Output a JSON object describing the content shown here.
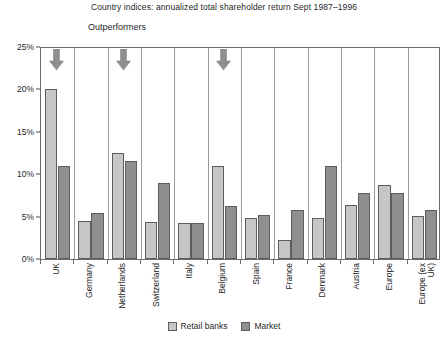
{
  "chart_data": {
    "type": "bar",
    "title": "Country indices: annualized total shareholder return Sept 1987–1996",
    "annotation_label": "Outperformers",
    "xlabel": "",
    "ylabel": "",
    "ylim": [
      0,
      25
    ],
    "ytick_labels": [
      "0%",
      "5%",
      "10%",
      "15%",
      "20%",
      "25%"
    ],
    "ytick_values": [
      0,
      5,
      10,
      15,
      20,
      25
    ],
    "grid": "vertical category separators only",
    "legend_position": "bottom-center",
    "categories": [
      "UK",
      "Germany",
      "Netherlands",
      "Switzerland",
      "Italy",
      "Belgium",
      "Spain",
      "France",
      "Denmark",
      "Austria",
      "Europe",
      "Europe (ex\nUK)"
    ],
    "series": [
      {
        "name": "Retail banks",
        "color": "#c6c6c6",
        "values": [
          20.0,
          4.5,
          12.5,
          4.4,
          4.2,
          11.0,
          4.8,
          2.3,
          4.8,
          6.4,
          8.7,
          5.1
        ]
      },
      {
        "name": "Market",
        "color": "#8f8f8f",
        "values": [
          11.0,
          5.4,
          11.5,
          9.0,
          4.2,
          6.2,
          5.2,
          5.8,
          11.0,
          7.8,
          7.8,
          5.8
        ]
      }
    ],
    "annotations": [
      {
        "type": "down-arrow",
        "category": "UK",
        "label": "Outperformers"
      },
      {
        "type": "down-arrow",
        "category": "Netherlands",
        "label": "Outperformers"
      },
      {
        "type": "down-arrow",
        "category": "Belgium",
        "label": "Outperformers"
      }
    ],
    "arrow_color": "#8f8f8f"
  }
}
